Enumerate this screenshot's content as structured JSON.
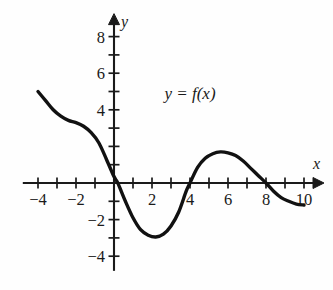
{
  "figure": {
    "background_color": "#fefefe",
    "curve_color": "#111111",
    "axis_color": "#1a1a1a",
    "annotation": "y = f(x)",
    "x_axis_name": "x",
    "y_axis_name": "y"
  },
  "chart_data": {
    "type": "line",
    "title": "",
    "subtitle": "",
    "xlabel": "x",
    "ylabel": "y",
    "xlim": [
      -4.8,
      11.0
    ],
    "ylim": [
      -4.8,
      9.2
    ],
    "grid": false,
    "legend": "none",
    "annotations": [
      {
        "text": "y = f(x)",
        "x": 4.0,
        "y": 4.6
      }
    ],
    "x_ticks": [
      -4,
      -3,
      -2,
      -1,
      0,
      1,
      2,
      3,
      4,
      5,
      6,
      7,
      8,
      9,
      10
    ],
    "x_tick_labels": [
      {
        "value": -4,
        "label": "−4"
      },
      {
        "value": -2,
        "label": "−2"
      },
      {
        "value": 2,
        "label": "2"
      },
      {
        "value": 4,
        "label": "4"
      },
      {
        "value": 6,
        "label": "6"
      },
      {
        "value": 8,
        "label": "8"
      },
      {
        "value": 10,
        "label": "10"
      }
    ],
    "y_ticks": [
      -4,
      -3,
      -2,
      -1,
      1,
      2,
      3,
      4,
      5,
      6,
      7,
      8
    ],
    "y_tick_labels": [
      {
        "value": 8,
        "label": "8"
      },
      {
        "value": 6,
        "label": "6"
      },
      {
        "value": 4,
        "label": "4"
      },
      {
        "value": -2,
        "label": "−2"
      },
      {
        "value": -4,
        "label": "−4"
      }
    ],
    "series": [
      {
        "name": "f(x)",
        "x": [
          -4.0,
          -3.6,
          -3.2,
          -2.8,
          -2.4,
          -2.0,
          -1.6,
          -1.2,
          -0.8,
          -0.4,
          0.0,
          0.2,
          0.6,
          1.0,
          1.4,
          1.8,
          2.2,
          2.6,
          3.0,
          3.4,
          3.8,
          4.0,
          4.4,
          4.8,
          5.2,
          5.6,
          6.0,
          6.4,
          6.8,
          7.2,
          7.6,
          8.0,
          8.4,
          8.8,
          9.2,
          9.6,
          10.0
        ],
        "values": [
          5.0,
          4.5,
          4.0,
          3.65,
          3.42,
          3.3,
          3.1,
          2.75,
          2.2,
          1.3,
          0.35,
          0.0,
          -1.0,
          -1.9,
          -2.55,
          -2.85,
          -2.95,
          -2.8,
          -2.35,
          -1.6,
          -0.45,
          0.0,
          0.85,
          1.35,
          1.6,
          1.7,
          1.65,
          1.5,
          1.2,
          0.8,
          0.4,
          0.0,
          -0.45,
          -0.8,
          -1.0,
          -1.15,
          -1.2
        ]
      }
    ],
    "key_points": {
      "left_endpoint": {
        "x": -4.0,
        "y": 5.0
      },
      "plateau": {
        "x": -2.2,
        "y": 3.3
      },
      "zero_1": {
        "x": 0.2,
        "y": 0.0
      },
      "local_min": {
        "x": 2.2,
        "y": -2.95
      },
      "zero_2": {
        "x": 4.0,
        "y": 0.0
      },
      "local_max": {
        "x": 5.9,
        "y": 1.7
      },
      "zero_3": {
        "x": 8.0,
        "y": 0.0
      },
      "right_endpoint": {
        "x": 10.0,
        "y": -1.2
      }
    }
  }
}
